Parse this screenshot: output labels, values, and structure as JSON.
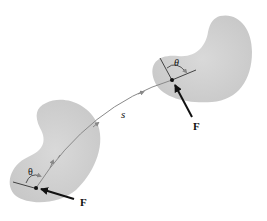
{
  "diagram": {
    "type": "work-of-force-along-path",
    "colors": {
      "body_fill": "#d2d2d2",
      "body_edge": "#e4e4e4",
      "path": "#8a8a8a",
      "line": "#333333",
      "force": "#111111"
    },
    "labels": {
      "path_length": "s",
      "angle_start": "θ",
      "angle_end": "θ",
      "force_start": "F",
      "force_end": "F"
    }
  }
}
